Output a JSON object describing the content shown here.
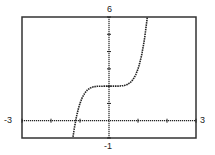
{
  "chart_data": {
    "type": "line",
    "title": "",
    "function": "y = x^5 + 2",
    "xlabel": "",
    "ylabel": "",
    "xlim": [
      -3,
      3
    ],
    "ylim": [
      -1,
      6
    ],
    "x_tick_step": 1,
    "y_tick_step": 1,
    "grid": false,
    "axis_labels": {
      "xmin": "-3",
      "xmax": "3",
      "ymin": "-1",
      "ymax": "6"
    },
    "series": [
      {
        "name": "f(x)",
        "x": [
          -1.15,
          -1.1,
          -1.0,
          -0.9,
          -0.8,
          -0.6,
          -0.4,
          0,
          0.4,
          0.6,
          0.8,
          0.9,
          1.0,
          1.1,
          1.2,
          1.32
        ],
        "values": [
          -0.01,
          0.39,
          1.0,
          1.41,
          1.67,
          1.92,
          1.99,
          2.0,
          2.01,
          2.08,
          2.33,
          2.59,
          3.0,
          3.61,
          4.49,
          6.0
        ]
      }
    ],
    "legend": null
  },
  "style": {
    "frame_color": "#333333",
    "curve_color": "#222222",
    "background": "#ffffff"
  }
}
